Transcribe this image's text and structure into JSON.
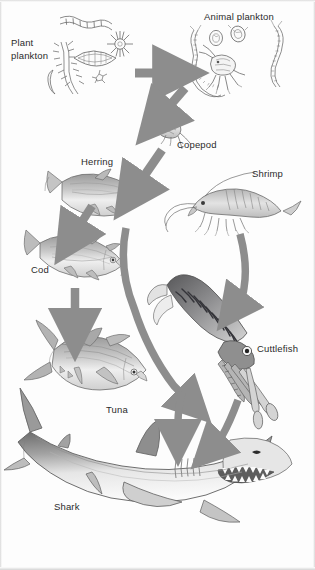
{
  "diagram": {
    "type": "marine-food-chain",
    "width": 315,
    "height": 570,
    "background_color": "#fdfdfd",
    "arrow_color": "#8a8a8a",
    "label_color": "#2b2b2b"
  },
  "labels": {
    "plant_plankton": "Plant\nplankton",
    "animal_plankton": "Animal plankton",
    "copepod": "Copepod",
    "herring": "Herring",
    "shrimp": "Shrimp",
    "cod": "Cod",
    "cuttlefish": "Cuttlefish",
    "tuna": "Tuna",
    "shark": "Shark"
  },
  "organisms": [
    {
      "id": "plant-plankton",
      "label": "Plant plankton",
      "trophic_level": 1,
      "x": 95,
      "y": 60
    },
    {
      "id": "animal-plankton",
      "label": "Animal plankton",
      "trophic_level": 2,
      "x": 245,
      "y": 65
    },
    {
      "id": "copepod",
      "label": "Copepod",
      "trophic_level": 2,
      "x": 172,
      "y": 130
    },
    {
      "id": "herring",
      "label": "Herring",
      "trophic_level": 3,
      "x": 105,
      "y": 195
    },
    {
      "id": "shrimp",
      "label": "Shrimp",
      "trophic_level": 3,
      "x": 245,
      "y": 205
    },
    {
      "id": "cod",
      "label": "Cod",
      "trophic_level": 4,
      "x": 85,
      "y": 258
    },
    {
      "id": "cuttlefish",
      "label": "Cuttlefish",
      "trophic_level": 4,
      "x": 215,
      "y": 330
    },
    {
      "id": "tuna",
      "label": "Tuna",
      "trophic_level": 5,
      "x": 95,
      "y": 355
    },
    {
      "id": "shark",
      "label": "Shark",
      "trophic_level": 6,
      "x": 160,
      "y": 480
    }
  ],
  "arrows": [
    {
      "from": "plant-plankton",
      "to": "animal-plankton",
      "style": "straight"
    },
    {
      "from": "animal-plankton",
      "to": "copepod",
      "style": "straight"
    },
    {
      "from": "copepod",
      "to": "herring",
      "style": "straight"
    },
    {
      "from": "herring",
      "to": "cod",
      "style": "straight"
    },
    {
      "from": "cod",
      "to": "tuna",
      "style": "straight"
    },
    {
      "from": "herring",
      "to": "shark",
      "style": "curved"
    },
    {
      "from": "shrimp",
      "to": "cuttlefish",
      "style": "curved"
    },
    {
      "from": "cuttlefish",
      "to": "shark",
      "style": "curved"
    },
    {
      "from": "tuna",
      "to": "shark",
      "style": "curved"
    }
  ]
}
